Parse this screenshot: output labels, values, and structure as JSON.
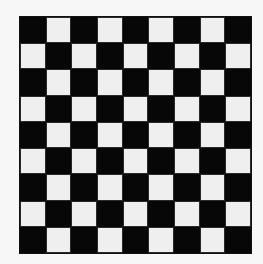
{
  "board": {
    "rows": 9,
    "cols": 9,
    "top_left_color": "dark",
    "colors": {
      "dark": "#070707",
      "light": "#efefef",
      "background": "#f7f7f7"
    },
    "pattern": [
      [
        "dark",
        "light",
        "dark",
        "light",
        "dark",
        "light",
        "dark",
        "light",
        "dark"
      ],
      [
        "light",
        "dark",
        "light",
        "dark",
        "light",
        "dark",
        "light",
        "dark",
        "light"
      ],
      [
        "dark",
        "light",
        "dark",
        "light",
        "dark",
        "light",
        "dark",
        "light",
        "dark"
      ],
      [
        "light",
        "dark",
        "light",
        "dark",
        "light",
        "dark",
        "light",
        "dark",
        "light"
      ],
      [
        "dark",
        "light",
        "dark",
        "light",
        "dark",
        "light",
        "dark",
        "light",
        "dark"
      ],
      [
        "light",
        "dark",
        "light",
        "dark",
        "light",
        "dark",
        "light",
        "dark",
        "light"
      ],
      [
        "dark",
        "light",
        "dark",
        "light",
        "dark",
        "light",
        "dark",
        "light",
        "dark"
      ],
      [
        "light",
        "dark",
        "light",
        "dark",
        "light",
        "dark",
        "light",
        "dark",
        "light"
      ],
      [
        "dark",
        "light",
        "dark",
        "light",
        "dark",
        "light",
        "dark",
        "light",
        "dark"
      ]
    ]
  }
}
